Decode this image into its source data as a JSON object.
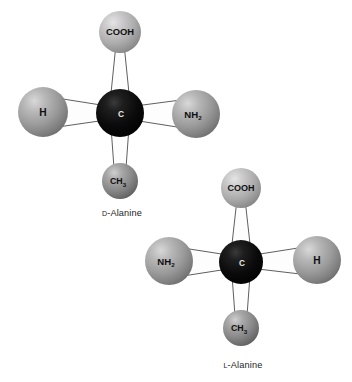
{
  "figure": {
    "background_color": "#ffffff"
  },
  "palette": {
    "carbon_color": "#080808",
    "substituent_gray": "#9a9a9a",
    "substituent_light_gray": "#b4b4b4",
    "methyl_gray": "#8a8a8a",
    "bond_fill": "#fdfdfd",
    "bond_outline": "#2a2a2a",
    "label_dark": "#101010",
    "label_light": "#e8e8e8",
    "caption_color": "#1c1c1c"
  },
  "molecules": [
    {
      "id": "d-alanine",
      "caption_prefix": "D",
      "caption_name": "-Alanine",
      "caption_full": "D-Alanine",
      "caption_x": 122,
      "caption_y": 216,
      "center": {
        "cx": 120,
        "cy": 113,
        "r": 24,
        "label": "C",
        "shade": "carbon"
      },
      "substituents": [
        {
          "name": "carboxyl",
          "label": "COOH",
          "sub": "",
          "cx": 120,
          "cy": 32,
          "r": 21,
          "shade": "light",
          "font_size": 9.4,
          "bond": "vertical-up"
        },
        {
          "name": "hydrogen",
          "label": "H",
          "sub": "",
          "cx": 43,
          "cy": 112,
          "r": 25,
          "shade": "medium",
          "font_size": 10.2,
          "bond": "horizontal-left"
        },
        {
          "name": "amino",
          "label": "NH",
          "sub": "2",
          "cx": 196,
          "cy": 114,
          "r": 24,
          "shade": "medium",
          "font_size": 9.6,
          "bond": "horizontal-right"
        },
        {
          "name": "methyl",
          "label": "CH",
          "sub": "3",
          "cx": 120,
          "cy": 181,
          "r": 18,
          "shade": "methyl",
          "font_size": 8.8,
          "bond": "vertical-down"
        }
      ]
    },
    {
      "id": "l-alanine",
      "caption_prefix": "L",
      "caption_name": "-Alanine",
      "caption_full": "L-Alanine",
      "caption_x": 243,
      "caption_y": 368,
      "center": {
        "cx": 241,
        "cy": 262,
        "r": 22,
        "label": "C",
        "shade": "carbon"
      },
      "substituents": [
        {
          "name": "carboxyl",
          "label": "COOH",
          "sub": "",
          "cx": 241,
          "cy": 188,
          "r": 20,
          "shade": "light",
          "font_size": 9.0,
          "bond": "vertical-up"
        },
        {
          "name": "amino",
          "label": "NH",
          "sub": "2",
          "cx": 169,
          "cy": 261,
          "r": 24,
          "shade": "medium",
          "font_size": 9.6,
          "bond": "horizontal-left"
        },
        {
          "name": "hydrogen",
          "label": "H",
          "sub": "",
          "cx": 317,
          "cy": 260,
          "r": 24,
          "shade": "medium",
          "font_size": 10.2,
          "bond": "horizontal-right"
        },
        {
          "name": "methyl",
          "label": "CH",
          "sub": "3",
          "cx": 241,
          "cy": 328,
          "r": 18,
          "shade": "methyl",
          "font_size": 8.8,
          "bond": "vertical-down"
        }
      ]
    }
  ]
}
